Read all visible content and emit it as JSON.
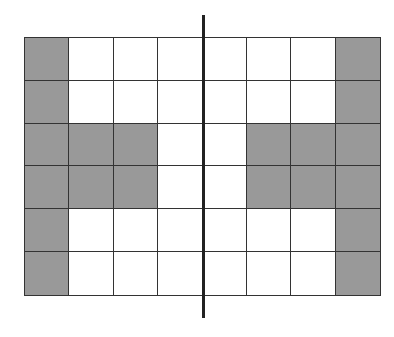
{
  "grid": {
    "rows": 6,
    "cols": 8,
    "colors": {
      "shaded": "#999999",
      "empty": "#ffffff",
      "line": "#333333"
    },
    "cells": [
      [
        1,
        0,
        0,
        0,
        0,
        0,
        0,
        1
      ],
      [
        1,
        0,
        0,
        0,
        0,
        0,
        0,
        1
      ],
      [
        1,
        1,
        1,
        0,
        0,
        1,
        1,
        1
      ],
      [
        1,
        1,
        1,
        0,
        0,
        1,
        1,
        1
      ],
      [
        1,
        0,
        0,
        0,
        0,
        0,
        0,
        1
      ],
      [
        1,
        0,
        0,
        0,
        0,
        0,
        0,
        1
      ]
    ]
  },
  "axis": {
    "type": "vertical-line-of-symmetry",
    "position": "between col 3 and col 4"
  }
}
